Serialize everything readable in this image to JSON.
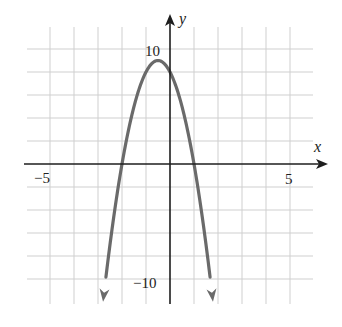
{
  "chart_data": {
    "type": "line",
    "title": "",
    "xlabel": "x",
    "ylabel": "y",
    "function": "y = -4x^2 - 4x + 8",
    "vertex": [
      -0.5,
      9
    ],
    "x_intercepts": [
      -2,
      1
    ],
    "y_intercept": 8,
    "xlim": [
      -6,
      6
    ],
    "ylim": [
      -12,
      12
    ],
    "grid": true,
    "grid_x_step": 1,
    "grid_y_step": 2,
    "x_tick_labels": [
      {
        "value": -5,
        "label": "−5"
      },
      {
        "value": 5,
        "label": "5"
      }
    ],
    "y_tick_labels": [
      {
        "value": 10,
        "label": "10"
      },
      {
        "value": -10,
        "label": "−10"
      }
    ],
    "series": [
      {
        "name": "parabola",
        "x": [
          -2.79,
          -2.5,
          -2,
          -1.5,
          -1,
          -0.5,
          0,
          0.5,
          1,
          1.5,
          1.79
        ],
        "y": [
          -12,
          -7,
          0,
          5,
          8,
          9,
          8,
          5,
          0,
          -7,
          -12
        ],
        "ends_with_arrows": true
      }
    ],
    "legend": "none"
  },
  "colors": {
    "background": "#ffffff",
    "grid": "#cfcfcf",
    "axis": "#1e1e1e",
    "curve": "#6a6a6a",
    "text": "#222222"
  },
  "labels": {
    "x_axis": "x",
    "y_axis": "y",
    "x_neg5": "−5",
    "x_pos5": "5",
    "y_pos10": "10",
    "y_neg10": "−10"
  }
}
